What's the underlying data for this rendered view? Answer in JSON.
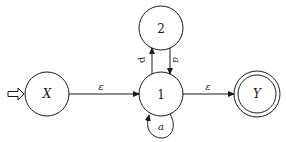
{
  "diagram": {
    "type": "finite-automaton",
    "colors": {
      "stroke": "#1a1a1a",
      "background": "#ffffff"
    },
    "states": [
      {
        "id": "X",
        "label": "X",
        "start": true,
        "accepting": false
      },
      {
        "id": "1",
        "label": "1",
        "start": false,
        "accepting": false
      },
      {
        "id": "2",
        "label": "2",
        "start": false,
        "accepting": false
      },
      {
        "id": "Y",
        "label": "Y",
        "start": false,
        "accepting": true
      }
    ],
    "transitions": [
      {
        "from": "X",
        "to": "1",
        "label": "ε"
      },
      {
        "from": "1",
        "to": "Y",
        "label": "ε"
      },
      {
        "from": "1",
        "to": "2",
        "label": "b"
      },
      {
        "from": "2",
        "to": "1",
        "label": "a"
      },
      {
        "from": "1",
        "to": "1",
        "label": "a"
      }
    ],
    "start_marker": "hollow-arrow-icon"
  }
}
